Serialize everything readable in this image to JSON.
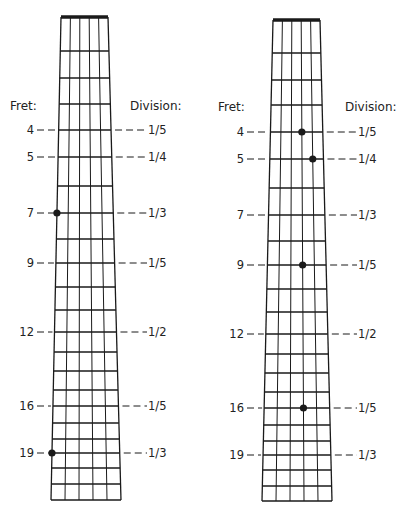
{
  "labels": {
    "fret_header": "Fret:",
    "division_header": "Division:"
  },
  "colors": {
    "ink": "#1a1a1a",
    "background": "#ffffff"
  },
  "fretboard": {
    "strings": 6,
    "frets_drawn": 21,
    "marked_frets": [
      {
        "fret": 4,
        "division": "1/5"
      },
      {
        "fret": 5,
        "division": "1/4"
      },
      {
        "fret": 7,
        "division": "1/3"
      },
      {
        "fret": 9,
        "division": "1/5"
      },
      {
        "fret": 12,
        "division": "1/2"
      },
      {
        "fret": 16,
        "division": "1/5"
      },
      {
        "fret": 19,
        "division": "1/3"
      }
    ]
  },
  "diagrams": [
    {
      "name": "left-fretboard",
      "geometry": {
        "nut_y": 17,
        "bottom_y": 500,
        "top_left_x": 61,
        "top_right_x": 108,
        "bottom_left_x": 51,
        "bottom_right_x": 121,
        "fret_y": [
          17,
          51,
          78,
          104,
          130,
          157,
          186,
          213,
          239,
          263,
          287,
          310,
          332,
          352,
          371,
          390,
          406,
          423,
          439,
          453,
          468,
          484,
          500
        ],
        "fret_label_x": 34,
        "division_label_x": 148,
        "header_y": 110,
        "fret_header_x": 10,
        "division_header_x": 130
      },
      "dots": [
        {
          "fret": 7,
          "string": 1
        },
        {
          "fret": 19,
          "string": 1
        }
      ]
    },
    {
      "name": "right-fretboard",
      "geometry": {
        "nut_y": 20,
        "bottom_y": 501,
        "top_left_x": 273,
        "top_right_x": 320,
        "bottom_left_x": 262,
        "bottom_right_x": 332,
        "fret_y": [
          20,
          53,
          80,
          105,
          132,
          159,
          188,
          215,
          241,
          265,
          289,
          312,
          334,
          354,
          373,
          392,
          408,
          425,
          441,
          455,
          470,
          486,
          501
        ],
        "fret_label_x": 244,
        "division_label_x": 358,
        "header_y": 111,
        "fret_header_x": 218,
        "division_header_x": 345
      },
      "dots": [
        {
          "fret": 4,
          "string": 4
        },
        {
          "fret": 5,
          "string": 5
        },
        {
          "fret": 9,
          "string": 4
        },
        {
          "fret": 16,
          "string": 4
        }
      ]
    }
  ]
}
